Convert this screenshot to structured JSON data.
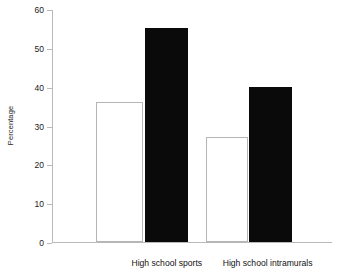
{
  "chart_data": {
    "type": "bar",
    "title": "",
    "subtitle": "",
    "xlabel": "",
    "ylabel": "Percentage",
    "ylim": [
      0,
      60
    ],
    "ytick_values": [
      60,
      50,
      40,
      30,
      20,
      10,
      0
    ],
    "ytick_labels": [
      "60",
      "50",
      "40",
      "30",
      "20",
      "10",
      "0"
    ],
    "grid": false,
    "legend": null,
    "legend_position": "none",
    "categories": [
      "High school sports",
      "High school intramurals"
    ],
    "series": [
      {
        "name": "series-1-open",
        "style": "open",
        "color": "#ffffff",
        "edge_color": "#b5b5b5",
        "values": [
          36,
          27
        ]
      },
      {
        "name": "series-2-filled",
        "style": "filled",
        "color": "#0a0a0a",
        "edge_color": "#0a0a0a",
        "values": [
          55,
          40
        ]
      }
    ],
    "bars": [
      {
        "category": "High school sports",
        "series": "series-1-open",
        "value": 36,
        "x_center_pct": 24.0,
        "width_pct": 16.8
      },
      {
        "category": "High school sports",
        "series": "series-2-filled",
        "value": 55,
        "x_center_pct": 41.0,
        "width_pct": 15.4
      },
      {
        "category": "High school intramurals",
        "series": "series-1-open",
        "value": 27,
        "x_center_pct": 62.5,
        "width_pct": 15.0
      },
      {
        "category": "High school intramurals",
        "series": "series-2-filled",
        "value": 40,
        "x_center_pct": 78.0,
        "width_pct": 15.4
      }
    ],
    "category_label_x_pct": [
      41.0,
      77.0
    ]
  },
  "axis": {
    "y_title": "Percentage"
  },
  "colors": {
    "background": "#ffffff",
    "axis": "#b9b9b9",
    "text": "#111111",
    "bar_filled": "#0a0a0a",
    "bar_open_edge": "#b5b5b5"
  }
}
